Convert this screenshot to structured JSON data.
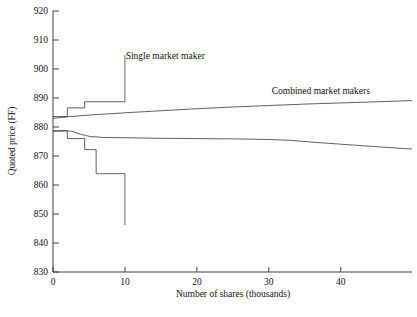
{
  "chart_data": {
    "type": "line",
    "title": "",
    "xlabel": "Number of shares (thousands)",
    "ylabel": "Quoted price (FF)",
    "xlim": [
      0,
      49.9
    ],
    "ylim": [
      830,
      920
    ],
    "xticks": [
      0,
      10,
      20,
      30,
      40
    ],
    "xtick_labels": [
      "0",
      "10",
      "20",
      "30",
      "40"
    ],
    "yticks": [
      830,
      840,
      850,
      860,
      870,
      880,
      890,
      900,
      910,
      920
    ],
    "ytick_labels": [
      "830",
      "840",
      "850",
      "860",
      "870",
      "880",
      "890",
      "900",
      "910",
      "920"
    ],
    "grid": false,
    "legend_position": "inline-annotations",
    "annotations": [
      {
        "text": "Single market maker",
        "x": 10.1,
        "y": 903.5,
        "anchor": "start"
      },
      {
        "text": "Combined market makers",
        "x": 30.4,
        "y": 891.5,
        "anchor": "start"
      }
    ],
    "series": [
      {
        "name": "Single market maker ask (step)",
        "style": "step-post",
        "points": [
          [
            0.0,
            883.6
          ],
          [
            2.0,
            883.6
          ],
          [
            2.0,
            886.6
          ],
          [
            4.4,
            886.6
          ],
          [
            4.4,
            888.7
          ],
          [
            10.0,
            888.7
          ],
          [
            10.0,
            904.8
          ]
        ]
      },
      {
        "name": "Single market maker bid (step)",
        "style": "step-post",
        "points": [
          [
            0.0,
            878.6
          ],
          [
            2.0,
            878.6
          ],
          [
            2.0,
            876.0
          ],
          [
            4.4,
            876.0
          ],
          [
            4.4,
            872.2
          ],
          [
            6.0,
            872.2
          ],
          [
            6.0,
            863.9
          ],
          [
            10.0,
            863.9
          ],
          [
            10.0,
            846.2
          ]
        ]
      },
      {
        "name": "Combined market makers ask",
        "style": "smooth",
        "points": [
          [
            0.0,
            883.0
          ],
          [
            2.4,
            883.6
          ],
          [
            5.0,
            884.1
          ],
          [
            10.0,
            884.9
          ],
          [
            15.0,
            885.6
          ],
          [
            20.0,
            886.3
          ],
          [
            25.0,
            886.9
          ],
          [
            30.0,
            887.4
          ],
          [
            35.0,
            887.9
          ],
          [
            40.0,
            888.3
          ],
          [
            45.0,
            888.7
          ],
          [
            49.9,
            889.1
          ]
        ]
      },
      {
        "name": "Combined market makers bid",
        "style": "smooth",
        "points": [
          [
            0.0,
            878.6
          ],
          [
            1.6,
            878.8
          ],
          [
            2.6,
            878.5
          ],
          [
            4.0,
            877.4
          ],
          [
            5.2,
            876.7
          ],
          [
            7.0,
            876.4
          ],
          [
            10.0,
            876.3
          ],
          [
            15.0,
            876.1
          ],
          [
            20.0,
            876.0
          ],
          [
            25.0,
            875.9
          ],
          [
            30.0,
            875.7
          ],
          [
            33.0,
            875.4
          ],
          [
            37.0,
            874.6
          ],
          [
            41.0,
            873.9
          ],
          [
            45.0,
            873.2
          ],
          [
            49.9,
            872.4
          ]
        ]
      }
    ]
  }
}
